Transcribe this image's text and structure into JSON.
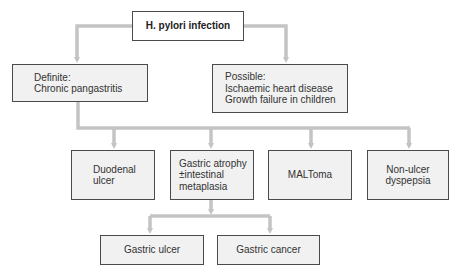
{
  "diagram": {
    "title": "H. pylori infection",
    "colors": {
      "connector": "#c4c4c4",
      "box_fill": "#f1f1f1",
      "box_border": "#4a4a4a",
      "root_fill": "#ffffff",
      "text": "#333333"
    },
    "root": {
      "label": "H. pylori infection"
    },
    "level1": {
      "definite": {
        "heading": "Definite:",
        "line1": "Chronic pangastritis"
      },
      "possible": {
        "heading": "Possible:",
        "line1": "Ischaemic heart disease",
        "line2": "Growth failure in children"
      }
    },
    "level2": {
      "duodenal": {
        "line1": "Duodenal",
        "line2": "ulcer"
      },
      "atrophy": {
        "line1": "Gastric atrophy",
        "line2": "±intestinal",
        "line3": "metaplasia"
      },
      "maltoma": {
        "line1": "MALToma"
      },
      "nonulcer": {
        "line1": "Non-ulcer",
        "line2": "dyspepsia"
      }
    },
    "level3": {
      "ulcer": {
        "line1": "Gastric ulcer"
      },
      "cancer": {
        "line1": "Gastric cancer"
      }
    }
  }
}
